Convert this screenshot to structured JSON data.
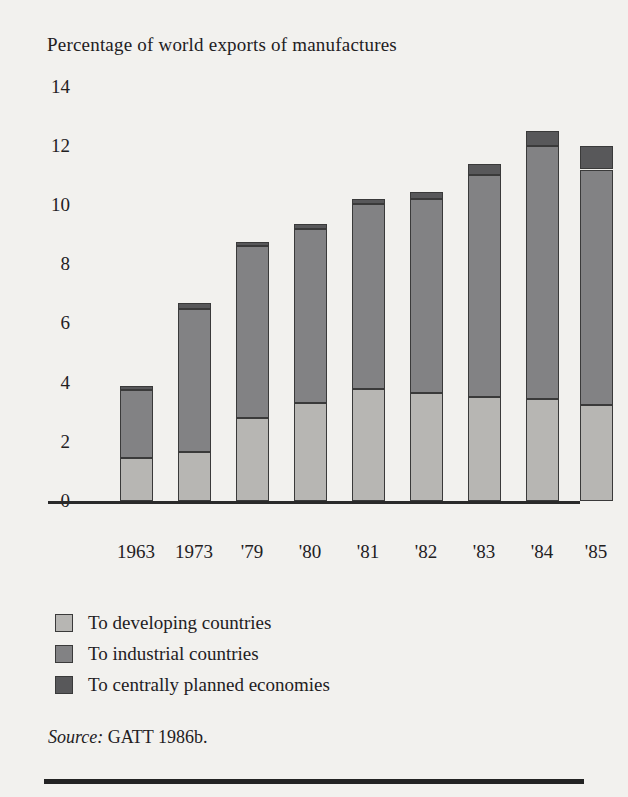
{
  "chart_title": "Percentage of world exports of manufactures",
  "source": {
    "label": "Source:",
    "value": "GATT 1986b."
  },
  "legend": {
    "items": [
      {
        "label": "To developing countries",
        "color": "#b7b6b3",
        "key": "developing"
      },
      {
        "label": "To industrial countries",
        "color": "#828284",
        "key": "industrial"
      },
      {
        "label": "To centrally planned economies",
        "color": "#58585a",
        "key": "centrally"
      }
    ]
  },
  "axis": {
    "y_ticks": [
      "0",
      "2",
      "4",
      "6",
      "8",
      "10",
      "12",
      "14"
    ],
    "x_ticks": [
      "1963",
      "1973",
      "'79",
      "'80",
      "'81",
      "'82",
      "'83",
      "'84",
      "'85"
    ]
  },
  "chart_data": {
    "type": "bar",
    "stacked": true,
    "title": "Percentage of world exports of manufactures",
    "xlabel": "",
    "ylabel": "Percentage of world exports of manufactures",
    "ylim": [
      0,
      14
    ],
    "ytick_step": 2,
    "grid": false,
    "legend_position": "below-plot",
    "categories": [
      "1963",
      "1973",
      "'79",
      "'80",
      "'81",
      "'82",
      "'83",
      "'84",
      "'85"
    ],
    "series": [
      {
        "name": "To developing countries",
        "color": "#b7b6b3",
        "values": [
          1.45,
          1.65,
          2.8,
          3.3,
          3.8,
          3.65,
          3.5,
          3.45,
          3.25
        ]
      },
      {
        "name": "To industrial countries",
        "color": "#828284",
        "values": [
          2.3,
          4.85,
          5.8,
          5.9,
          6.25,
          6.55,
          7.5,
          8.55,
          7.95
        ]
      },
      {
        "name": "To centrally planned economies",
        "color": "#58585a",
        "values": [
          0.15,
          0.2,
          0.15,
          0.15,
          0.15,
          0.25,
          0.4,
          0.5,
          0.8
        ]
      }
    ],
    "totals": [
      3.9,
      6.7,
      8.75,
      9.35,
      10.2,
      10.45,
      11.4,
      12.5,
      12.0
    ]
  },
  "render": {
    "baseline_y": 501,
    "px_per_unit": 29.6,
    "bar_width": 33,
    "bar_centers_x": [
      136,
      194,
      252,
      310,
      368,
      426,
      484,
      542,
      596
    ]
  }
}
